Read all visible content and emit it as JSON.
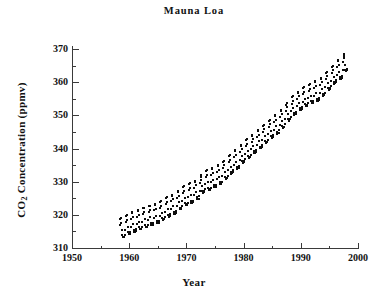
{
  "figure": {
    "title": "Mauna Loa",
    "background": "#ffffff",
    "ink_color": "#111111"
  },
  "axes": {
    "x_label": "Year",
    "y_label_prefix": "CO",
    "y_label_sub": "2",
    "y_label_suffix": " Concentration (ppmv)",
    "y_label_full": "CO2 Concentration (ppmv)",
    "x_ticks": [
      1950,
      1960,
      1970,
      1980,
      1990,
      2000
    ],
    "x_tick_labels": [
      "1950",
      "1960",
      "1970",
      "1980",
      "1990",
      "2000"
    ],
    "x_minor_ticks": [
      1955,
      1965,
      1975,
      1985,
      1995
    ],
    "y_ticks": [
      310,
      320,
      330,
      340,
      350,
      360,
      370
    ],
    "y_tick_labels": [
      "310",
      "320",
      "330",
      "340",
      "350",
      "360",
      "370"
    ],
    "y_minor_ticks": [
      315,
      325,
      335,
      345,
      355,
      365
    ]
  },
  "chart_data": {
    "type": "scatter",
    "title": "Mauna Loa",
    "xlabel": "Year",
    "ylabel": "CO2 Concentration (ppmv)",
    "xlim": [
      1950,
      2000
    ],
    "ylim": [
      310,
      370
    ],
    "grid": false,
    "legend": null,
    "marker": "filled-square",
    "marker_color": "#0d0d0d",
    "marker_size_px": 2,
    "series_name": "Monthly mean CO2",
    "x_start": 1958.2,
    "x_end": 1998.0,
    "seasonal_amplitude_ppmv": 3.1,
    "seasonal_peak_month": 5,
    "seasonal_trough_month": 10,
    "annual_means": [
      {
        "year": 1958,
        "value": 315.3
      },
      {
        "year": 1959,
        "value": 315.9
      },
      {
        "year": 1960,
        "value": 316.9
      },
      {
        "year": 1961,
        "value": 317.6
      },
      {
        "year": 1962,
        "value": 318.4
      },
      {
        "year": 1963,
        "value": 319.0
      },
      {
        "year": 1964,
        "value": 319.6
      },
      {
        "year": 1965,
        "value": 320.0
      },
      {
        "year": 1966,
        "value": 321.4
      },
      {
        "year": 1967,
        "value": 322.2
      },
      {
        "year": 1968,
        "value": 323.0
      },
      {
        "year": 1969,
        "value": 324.6
      },
      {
        "year": 1970,
        "value": 325.7
      },
      {
        "year": 1971,
        "value": 326.3
      },
      {
        "year": 1972,
        "value": 327.5
      },
      {
        "year": 1973,
        "value": 329.7
      },
      {
        "year": 1974,
        "value": 330.2
      },
      {
        "year": 1975,
        "value": 331.1
      },
      {
        "year": 1976,
        "value": 332.0
      },
      {
        "year": 1977,
        "value": 333.8
      },
      {
        "year": 1978,
        "value": 335.4
      },
      {
        "year": 1979,
        "value": 336.8
      },
      {
        "year": 1980,
        "value": 338.7
      },
      {
        "year": 1981,
        "value": 340.1
      },
      {
        "year": 1982,
        "value": 341.4
      },
      {
        "year": 1983,
        "value": 343.0
      },
      {
        "year": 1984,
        "value": 344.6
      },
      {
        "year": 1985,
        "value": 346.0
      },
      {
        "year": 1986,
        "value": 347.4
      },
      {
        "year": 1987,
        "value": 349.2
      },
      {
        "year": 1988,
        "value": 351.6
      },
      {
        "year": 1989,
        "value": 353.1
      },
      {
        "year": 1990,
        "value": 354.4
      },
      {
        "year": 1991,
        "value": 355.6
      },
      {
        "year": 1992,
        "value": 356.4
      },
      {
        "year": 1993,
        "value": 357.1
      },
      {
        "year": 1994,
        "value": 358.8
      },
      {
        "year": 1995,
        "value": 360.8
      },
      {
        "year": 1996,
        "value": 362.6
      },
      {
        "year": 1997,
        "value": 363.8
      },
      {
        "year": 1998,
        "value": 366.6
      }
    ]
  }
}
